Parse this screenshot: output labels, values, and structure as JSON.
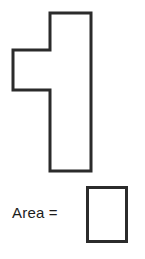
{
  "worksheet": {
    "title": "Area of a compound figure worksheet",
    "prompt_label": "Area =",
    "answer_value": "",
    "answer_placeholder": "",
    "stroke_color": "#2b2b2b",
    "fill_color": "#ffffff",
    "background_color": "#ffffff",
    "text_color": "#1c1c1c"
  },
  "figure": {
    "name": "compound-polygon",
    "stroke_width": 3,
    "vertices": [
      [
        50,
        13
      ],
      [
        91,
        13
      ],
      [
        91,
        171
      ],
      [
        50,
        171
      ],
      [
        50,
        90
      ],
      [
        13,
        90
      ],
      [
        13,
        50
      ],
      [
        50,
        50
      ]
    ],
    "points_path": "50,13 91,13 91,171 50,171 50,90 13,90 13,50 50,50"
  },
  "answer_box": {
    "label": "answer box",
    "x": 86,
    "y": 186,
    "width": 42,
    "height": 57
  }
}
